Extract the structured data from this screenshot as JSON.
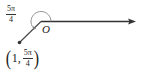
{
  "diagram": {
    "type": "polar-coordinate-plot",
    "origin_label": "O",
    "angle_label": {
      "numerator": "5π",
      "denominator": "4"
    },
    "point_label": {
      "open": "(",
      "r": "1",
      "separator": ",",
      "theta_numerator": "5π",
      "theta_denominator": "4",
      "close": ")"
    },
    "colors": {
      "ray": "#333333",
      "arc": "#777777",
      "point": "#333333"
    }
  }
}
